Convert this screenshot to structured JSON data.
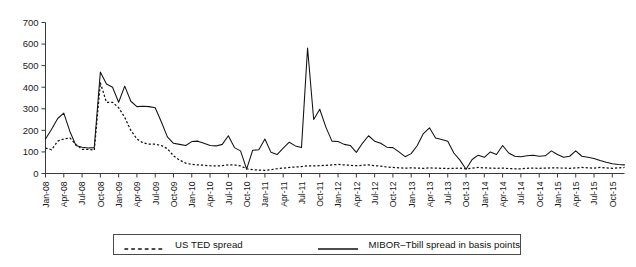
{
  "chart_data": {
    "type": "line",
    "title": "",
    "subtitle": "",
    "xlabel": "",
    "ylabel": "",
    "ylim": [
      0,
      700
    ],
    "yticks": [
      0,
      100,
      200,
      300,
      400,
      500,
      600,
      700
    ],
    "grid": false,
    "legend_position": "bottom",
    "tick_labels": [
      "Jan-08",
      "Apr-08",
      "Jul-08",
      "Oct-08",
      "Jan-09",
      "Apr-09",
      "Jul-09",
      "Oct-09",
      "Jan-10",
      "Apr-10",
      "Jul-10",
      "Oct-10",
      "Jan-11",
      "Apr-11",
      "Jul-11",
      "Oct-11",
      "Jan-12",
      "Apr-12",
      "Jul-12",
      "Oct-12",
      "Jan-13",
      "Apr-13",
      "Jul-13",
      "Oct-13",
      "Jan-14",
      "Apr-14",
      "Jul-14",
      "Oct-14",
      "Jan-15",
      "Apr-15",
      "Jul-15",
      "Oct-15"
    ],
    "x": [
      "Jan-08",
      "Feb-08",
      "Mar-08",
      "Apr-08",
      "May-08",
      "Jun-08",
      "Jul-08",
      "Aug-08",
      "Sep-08",
      "Oct-08",
      "Nov-08",
      "Dec-08",
      "Jan-09",
      "Feb-09",
      "Mar-09",
      "Apr-09",
      "May-09",
      "Jun-09",
      "Jul-09",
      "Aug-09",
      "Sep-09",
      "Oct-09",
      "Nov-09",
      "Dec-09",
      "Jan-10",
      "Feb-10",
      "Mar-10",
      "Apr-10",
      "May-10",
      "Jun-10",
      "Jul-10",
      "Aug-10",
      "Sep-10",
      "Oct-10",
      "Nov-10",
      "Dec-10",
      "Jan-11",
      "Feb-11",
      "Mar-11",
      "Apr-11",
      "May-11",
      "Jun-11",
      "Jul-11",
      "Aug-11",
      "Sep-11",
      "Oct-11",
      "Nov-11",
      "Dec-11",
      "Jan-12",
      "Feb-12",
      "Mar-12",
      "Apr-12",
      "May-12",
      "Jun-12",
      "Jul-12",
      "Aug-12",
      "Sep-12",
      "Oct-12",
      "Nov-12",
      "Dec-12",
      "Jan-13",
      "Feb-13",
      "Mar-13",
      "Apr-13",
      "May-13",
      "Jun-13",
      "Jul-13",
      "Aug-13",
      "Sep-13",
      "Oct-13",
      "Nov-13",
      "Dec-13",
      "Jan-14",
      "Feb-14",
      "Mar-14",
      "Apr-14",
      "May-14",
      "Jun-14",
      "Jul-14",
      "Aug-14",
      "Sep-14",
      "Oct-14",
      "Nov-14",
      "Dec-14",
      "Jan-15",
      "Feb-15",
      "Mar-15",
      "Apr-15",
      "May-15",
      "Jun-15",
      "Jul-15",
      "Aug-15",
      "Sep-15",
      "Oct-15",
      "Nov-15",
      "Dec-15"
    ],
    "series": [
      {
        "name": "MIBOR-Tbill spread in basis points",
        "style": "solid",
        "values": [
          160,
          205,
          255,
          280,
          195,
          130,
          122,
          118,
          120,
          470,
          415,
          400,
          330,
          405,
          335,
          310,
          312,
          310,
          305,
          240,
          170,
          140,
          135,
          130,
          148,
          150,
          140,
          130,
          128,
          135,
          175,
          120,
          105,
          20,
          108,
          110,
          160,
          98,
          88,
          118,
          145,
          128,
          120,
          582,
          250,
          298,
          215,
          150,
          148,
          135,
          130,
          98,
          140,
          175,
          150,
          140,
          122,
          120,
          100,
          78,
          92,
          130,
          185,
          212,
          165,
          158,
          150,
          95,
          62,
          20,
          65,
          85,
          75,
          100,
          88,
          130,
          95,
          80,
          78,
          82,
          85,
          80,
          82,
          105,
          88,
          75,
          80,
          105,
          80,
          75,
          70,
          60,
          52,
          45,
          42,
          40
        ]
      },
      {
        "name": "US TED spread",
        "style": "dotted",
        "values": [
          118,
          110,
          150,
          160,
          165,
          135,
          112,
          112,
          108,
          420,
          330,
          330,
          305,
          260,
          200,
          160,
          142,
          136,
          136,
          130,
          115,
          82,
          62,
          48,
          42,
          40,
          38,
          36,
          35,
          36,
          40,
          40,
          35,
          22,
          18,
          16,
          15,
          18,
          22,
          25,
          28,
          30,
          32,
          36,
          35,
          36,
          38,
          40,
          42,
          40,
          38,
          36,
          38,
          40,
          36,
          34,
          30,
          28,
          26,
          25,
          26,
          25,
          24,
          26,
          25,
          24,
          23,
          24,
          25,
          22,
          25,
          28,
          26,
          25,
          24,
          25,
          23,
          22,
          22,
          24,
          25,
          24,
          25,
          26,
          26,
          25,
          24,
          26,
          28,
          26,
          25,
          28,
          26,
          24,
          26,
          28
        ]
      }
    ]
  },
  "legend": {
    "entries": [
      {
        "label": "US TED spread",
        "style": "dotted"
      },
      {
        "label": "MIBOR–Tbill spread in basis points",
        "style": "solid"
      }
    ]
  },
  "colors": {
    "series_line": "#111111",
    "axis": "#3a3a3a",
    "background": "#ffffff",
    "legend_border": "#4a4a4a"
  }
}
